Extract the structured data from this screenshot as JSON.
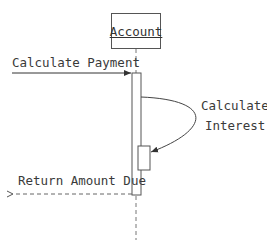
{
  "diagram": {
    "type": "uml-sequence",
    "lifeline": {
      "label": "Account"
    },
    "messages": [
      {
        "id": "calc-payment",
        "label": "Calculate Payment",
        "kind": "synchronous"
      },
      {
        "id": "calc-interest",
        "label_line1": "Calculate",
        "label_line2": "Interest",
        "kind": "self-call"
      },
      {
        "id": "return-amount",
        "label": "Return Amount Due",
        "kind": "return"
      }
    ]
  }
}
